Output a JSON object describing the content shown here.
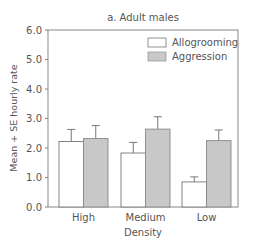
{
  "chart_data": {
    "type": "bar",
    "title": "a. Adult males",
    "xlabel": "Density",
    "ylabel": "Mean + SE hourly rate",
    "categories": [
      "High",
      "Medium",
      "Low"
    ],
    "series": [
      {
        "name": "Allogrooming",
        "color": "#ffffff",
        "values": [
          2.22,
          1.83,
          0.85
        ],
        "se_top": [
          2.63,
          2.19,
          1.02
        ]
      },
      {
        "name": "Aggression",
        "color": "#c8c8c8",
        "values": [
          2.32,
          2.64,
          2.25
        ],
        "se_top": [
          2.76,
          3.06,
          2.61
        ]
      }
    ],
    "ylim": [
      0,
      6
    ],
    "yticks": [
      "0.0",
      "1.0",
      "2.0",
      "3.0",
      "4.0",
      "5.0",
      "6.0"
    ],
    "grid": false,
    "legend_position": "top-right"
  }
}
